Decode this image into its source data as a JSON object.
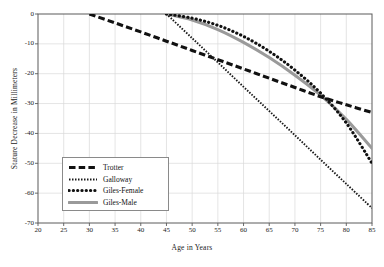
{
  "chart_data": {
    "type": "line",
    "title": "",
    "xlabel": "Age in Years",
    "ylabel": "Stature Decrease in Millimeters",
    "xlim": [
      20,
      85
    ],
    "ylim": [
      -70,
      0
    ],
    "xticks": [
      20,
      25,
      30,
      35,
      40,
      45,
      50,
      55,
      60,
      65,
      70,
      75,
      80,
      85
    ],
    "yticks": [
      0,
      -10,
      -20,
      -30,
      -40,
      -50,
      -60,
      -70
    ],
    "xtick_labels": [
      "20",
      "25",
      "30",
      "35",
      "40",
      "45",
      "50",
      "55",
      "60",
      "65",
      "70",
      "75",
      "80",
      "85"
    ],
    "ytick_labels": [
      "0",
      "-10",
      "-20",
      "-30",
      "-40",
      "-50",
      "-60",
      "-70"
    ],
    "grid": true,
    "legend_position": "lower-left-inside",
    "series": [
      {
        "name": "Trotter",
        "style": "thick-dashed",
        "color": "#111111",
        "x": [
          30,
          35,
          40,
          45,
          50,
          55,
          60,
          65,
          70,
          75,
          80,
          85
        ],
        "y": [
          0,
          -3.0,
          -6.0,
          -9.1,
          -12.2,
          -15.3,
          -18.4,
          -21.5,
          -24.6,
          -27.7,
          -30.4,
          -33.0
        ]
      },
      {
        "name": "Galloway",
        "style": "fine-dotted",
        "color": "#1a1a1a",
        "x": [
          45,
          50,
          55,
          60,
          65,
          70,
          75,
          80,
          85
        ],
        "y": [
          0,
          -8.1,
          -16.2,
          -24.4,
          -32.5,
          -40.6,
          -48.8,
          -56.9,
          -65.0
        ]
      },
      {
        "name": "Giles-Female",
        "style": "round-dotted",
        "color": "#111111",
        "x": [
          45,
          50,
          55,
          60,
          65,
          70,
          75,
          80,
          85
        ],
        "y": [
          0,
          -1.4,
          -3.8,
          -7.5,
          -12.5,
          -18.8,
          -26.5,
          -36.5,
          -50.0
        ]
      },
      {
        "name": "Giles-Male",
        "style": "solid-thick",
        "color": "#9a9a9a",
        "x": [
          45,
          50,
          55,
          60,
          65,
          70,
          75,
          80,
          85
        ],
        "y": [
          0,
          -2.0,
          -5.2,
          -9.5,
          -14.6,
          -20.5,
          -27.2,
          -35.3,
          -45.0
        ]
      }
    ]
  },
  "legend": {
    "items": [
      {
        "label": "Trotter"
      },
      {
        "label": "Galloway"
      },
      {
        "label": "Giles-Female"
      },
      {
        "label": "Giles-Male"
      }
    ]
  },
  "colors": {
    "axis": "#5a5a5a",
    "grid": "#d8d8d8",
    "background": "#ffffff",
    "gray_series": "#9a9a9a",
    "black_series": "#111111"
  }
}
